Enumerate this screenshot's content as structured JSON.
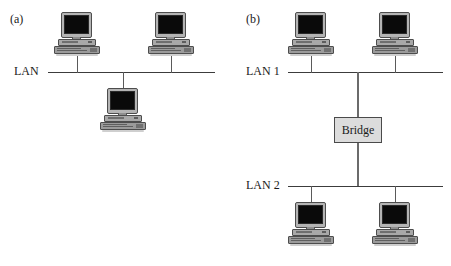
{
  "figure": {
    "type": "network-topology-diagram",
    "background_color": "#ffffff",
    "line_color": "#3c3c3c",
    "box_fill_color": "#dcdcdc",
    "screen_color": "#0a0a0a",
    "chassis_color": "#a8a8a8"
  },
  "panels": [
    {
      "id": "a",
      "label": "(a)",
      "lan_labels": [
        "LAN"
      ],
      "bridge": null,
      "node_icon_name": "computer-workstation-icon",
      "nodes": [
        {
          "name": "computer-a-top-left",
          "position": "above-bus-left"
        },
        {
          "name": "computer-a-top-right",
          "position": "above-bus-right"
        },
        {
          "name": "computer-a-bottom-center",
          "position": "below-bus-center"
        }
      ],
      "node_count": 3,
      "bus_count": 1
    },
    {
      "id": "b",
      "label": "(b)",
      "lan_labels": [
        "LAN 1",
        "LAN 2"
      ],
      "bridge": {
        "label": "Bridge",
        "name": "bridge-box"
      },
      "node_icon_name": "computer-workstation-icon",
      "nodes": [
        {
          "name": "computer-b-lan1-left",
          "position": "above-lan1-left"
        },
        {
          "name": "computer-b-lan1-right",
          "position": "above-lan1-right"
        },
        {
          "name": "computer-b-lan2-left",
          "position": "below-lan2-left"
        },
        {
          "name": "computer-b-lan2-right",
          "position": "below-lan2-right"
        }
      ],
      "node_count": 4,
      "bus_count": 2
    }
  ],
  "labels": {
    "panel_a": "(a)",
    "panel_b": "(b)",
    "lan": "LAN",
    "lan1": "LAN 1",
    "lan2": "LAN 2",
    "bridge": "Bridge"
  }
}
